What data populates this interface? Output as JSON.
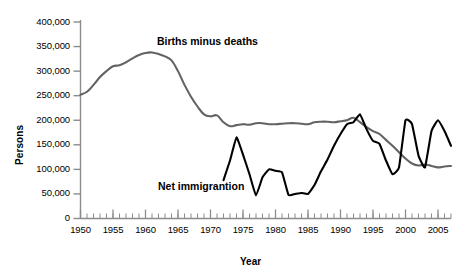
{
  "chart_data": {
    "type": "line",
    "title": "",
    "xlabel": "Year",
    "ylabel": "Persons",
    "xlim": [
      1950,
      2007
    ],
    "ylim": [
      0,
      400000
    ],
    "grid": false,
    "legend_position": "inline-annotations",
    "x_tick_labels": [
      "1950",
      "1955",
      "1960",
      "1965",
      "1970",
      "1975",
      "1980",
      "1985",
      "1990",
      "1995",
      "2000",
      "2005"
    ],
    "x_tick_values": [
      1950,
      1955,
      1960,
      1965,
      1970,
      1975,
      1980,
      1985,
      1990,
      1995,
      2000,
      2005
    ],
    "x_minor_tick_interval": 1,
    "y_tick_labels": [
      "0",
      "50,000",
      "100,000",
      "150,000",
      "200,000",
      "250,000",
      "300,000",
      "350,000",
      "400,000"
    ],
    "y_tick_values": [
      0,
      50000,
      100000,
      150000,
      200000,
      250000,
      300000,
      350000,
      400000
    ],
    "series": [
      {
        "name": "Births minus deaths",
        "color": "#636363",
        "annotation_label": "Births minus deaths",
        "x": [
          1950,
          1951,
          1952,
          1953,
          1954,
          1955,
          1956,
          1957,
          1958,
          1959,
          1960,
          1961,
          1962,
          1963,
          1964,
          1965,
          1966,
          1967,
          1968,
          1969,
          1970,
          1971,
          1972,
          1973,
          1974,
          1975,
          1976,
          1977,
          1978,
          1979,
          1980,
          1981,
          1982,
          1983,
          1984,
          1985,
          1986,
          1987,
          1988,
          1989,
          1990,
          1991,
          1992,
          1993,
          1994,
          1995,
          1996,
          1997,
          1998,
          1999,
          2000,
          2001,
          2002,
          2003,
          2004,
          2005,
          2006,
          2007
        ],
        "values": [
          252000,
          258000,
          272000,
          288000,
          300000,
          310000,
          312000,
          318000,
          326000,
          333000,
          337000,
          338000,
          335000,
          330000,
          322000,
          300000,
          272000,
          248000,
          228000,
          212000,
          208000,
          210000,
          196000,
          188000,
          190000,
          192000,
          191000,
          194000,
          194000,
          192000,
          192000,
          193000,
          194000,
          194000,
          193000,
          192000,
          196000,
          197000,
          197000,
          196000,
          198000,
          200000,
          205000,
          196000,
          186000,
          178000,
          172000,
          160000,
          148000,
          135000,
          122000,
          112000,
          108000,
          110000,
          107000,
          104000,
          106000,
          107000
        ]
      },
      {
        "name": "Net immigrantion",
        "color": "#000000",
        "annotation_label": "Net immigrantion",
        "x": [
          1972,
          1973,
          1974,
          1975,
          1976,
          1977,
          1978,
          1979,
          1980,
          1981,
          1982,
          1983,
          1984,
          1985,
          1986,
          1987,
          1988,
          1989,
          1990,
          1991,
          1992,
          1993,
          1994,
          1995,
          1996,
          1997,
          1998,
          1999,
          2000,
          2001,
          2002,
          2003,
          2004,
          2005,
          2006,
          2007
        ],
        "values": [
          78000,
          118000,
          165000,
          130000,
          90000,
          47000,
          84000,
          100000,
          97000,
          94000,
          48000,
          50000,
          52000,
          50000,
          68000,
          96000,
          120000,
          148000,
          172000,
          192000,
          196000,
          212000,
          182000,
          158000,
          152000,
          118000,
          90000,
          104000,
          200000,
          192000,
          128000,
          104000,
          178000,
          200000,
          178000,
          148000
        ]
      }
    ]
  },
  "axes": {
    "y_title": "Persons",
    "x_title": "Year"
  },
  "annotations": {
    "births_minus_deaths": "Births minus deaths",
    "net_immigration": "Net immigrantion"
  },
  "colors": {
    "births_line": "#636363",
    "immigration_line": "#000000",
    "axis": "#808080",
    "text": "#000000",
    "background": "#ffffff"
  }
}
